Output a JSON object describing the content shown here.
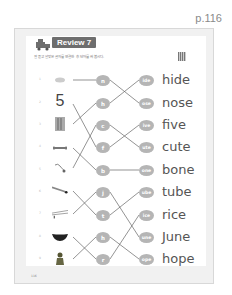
{
  "page_label": "p.116",
  "header": {
    "title": "Review 7",
    "instruction": "잘 듣고 알맞은 글자를 연결한 후 단어를 써 봅시다."
  },
  "footer": {
    "page_number": "116"
  },
  "rows": [
    {
      "num": "1",
      "picture": "cup",
      "left": "n",
      "right": "ide",
      "word": "hide"
    },
    {
      "num": "2",
      "picture": "5",
      "left": "h",
      "right": "ose",
      "word": "nose"
    },
    {
      "num": "3",
      "picture": "pencils",
      "left": "c",
      "right": "ive",
      "word": "five"
    },
    {
      "num": "4",
      "picture": "bone",
      "left": "f",
      "right": "ute",
      "word": "cute"
    },
    {
      "num": "5",
      "picture": "handshake",
      "left": "b",
      "right": "one",
      "word": "bone"
    },
    {
      "num": "6",
      "picture": "pen",
      "left": "j",
      "right": "ube",
      "word": "tube"
    },
    {
      "num": "7",
      "picture": "chopsticks",
      "left": "t",
      "right": "ice",
      "word": "rice"
    },
    {
      "num": "8",
      "picture": "bowl",
      "left": "h",
      "right": "une",
      "word": "June"
    },
    {
      "num": "9",
      "picture": "person",
      "left": "r",
      "right": "ope",
      "word": "hope"
    }
  ],
  "colors": {
    "bubble": "#b5b5b5",
    "badge": "#6e6e6e",
    "line": "#555555"
  }
}
